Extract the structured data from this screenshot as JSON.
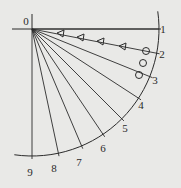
{
  "diagram": {
    "origin_label": "0",
    "origin": {
      "x": 32,
      "y": 29
    },
    "radius": 127,
    "colors": {
      "line": "#2b2b2b",
      "background": "#e9e9e7"
    },
    "rays": [
      {
        "label": "1",
        "angle_deg": 0,
        "label_pos": {
          "x": 163,
          "y": 29
        }
      },
      {
        "label": "2",
        "angle_deg": 11,
        "label_pos": {
          "x": 162,
          "y": 54
        }
      },
      {
        "label": "3",
        "angle_deg": 22,
        "label_pos": {
          "x": 155,
          "y": 80
        }
      },
      {
        "label": "4",
        "angle_deg": 33,
        "label_pos": {
          "x": 141,
          "y": 105
        }
      },
      {
        "label": "5",
        "angle_deg": 45,
        "label_pos": {
          "x": 125,
          "y": 128
        }
      },
      {
        "label": "6",
        "angle_deg": 56,
        "label_pos": {
          "x": 103,
          "y": 148
        }
      },
      {
        "label": "7",
        "angle_deg": 67,
        "label_pos": {
          "x": 79,
          "y": 162
        }
      },
      {
        "label": "8",
        "angle_deg": 78,
        "label_pos": {
          "x": 54,
          "y": 168
        }
      },
      {
        "label": "9",
        "angle_deg": 90,
        "label_pos": {
          "x": 30,
          "y": 172
        }
      }
    ],
    "triangle_markers": [
      {
        "x": 61,
        "y": 34
      },
      {
        "x": 81,
        "y": 38
      },
      {
        "x": 101,
        "y": 42
      },
      {
        "x": 123,
        "y": 47
      }
    ],
    "circle_markers": [
      {
        "x": 146,
        "y": 51
      },
      {
        "x": 143,
        "y": 63
      },
      {
        "x": 139,
        "y": 75
      }
    ]
  }
}
